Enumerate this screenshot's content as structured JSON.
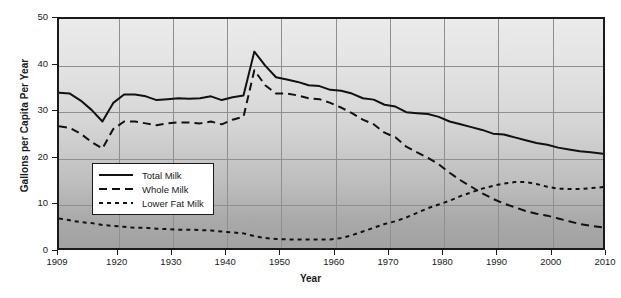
{
  "chart_data": {
    "type": "line",
    "title": "",
    "xlabel": "Year",
    "ylabel": "Gallons per Capita Per Year",
    "xlim": [
      1909,
      2010
    ],
    "ylim": [
      0,
      50
    ],
    "xticks": [
      1909,
      1920,
      1930,
      1940,
      1950,
      1960,
      1970,
      1980,
      1990,
      2000,
      2010
    ],
    "yticks": [
      0,
      10,
      20,
      30,
      40,
      50
    ],
    "grid": true,
    "legend_position": "inside-left",
    "x": [
      1909,
      1911,
      1913,
      1915,
      1917,
      1919,
      1921,
      1923,
      1925,
      1927,
      1929,
      1931,
      1933,
      1935,
      1937,
      1939,
      1941,
      1943,
      1945,
      1947,
      1949,
      1951,
      1953,
      1955,
      1957,
      1959,
      1961,
      1963,
      1965,
      1967,
      1969,
      1971,
      1973,
      1975,
      1977,
      1979,
      1981,
      1983,
      1985,
      1987,
      1989,
      1991,
      1993,
      1995,
      1997,
      1999,
      2001,
      2003,
      2005,
      2007,
      2010
    ],
    "series": [
      {
        "name": "Total Milk",
        "style": "solid",
        "color": "#111111",
        "values": [
          34.2,
          34.0,
          32.5,
          30.5,
          28.0,
          32.0,
          33.8,
          33.8,
          33.4,
          32.6,
          32.8,
          33.0,
          32.9,
          33.0,
          33.4,
          32.6,
          33.2,
          33.6,
          43.0,
          40.0,
          37.5,
          37.0,
          36.5,
          35.8,
          35.6,
          34.8,
          34.6,
          34.0,
          33.0,
          32.7,
          31.6,
          31.2,
          30.0,
          29.8,
          29.6,
          29.0,
          28.0,
          27.4,
          26.8,
          26.2,
          25.4,
          25.2,
          24.6,
          24.0,
          23.4,
          23.0,
          22.4,
          22.0,
          21.6,
          21.4,
          21.0
        ]
      },
      {
        "name": "Whole Milk",
        "style": "dashed",
        "color": "#111111",
        "values": [
          27.0,
          26.6,
          25.4,
          23.6,
          22.2,
          26.4,
          28.0,
          28.0,
          27.6,
          27.2,
          27.6,
          27.8,
          27.8,
          27.6,
          28.0,
          27.4,
          28.4,
          29.0,
          39.0,
          35.8,
          34.0,
          34.0,
          33.6,
          33.0,
          32.8,
          32.0,
          31.0,
          29.8,
          28.4,
          27.4,
          25.6,
          24.6,
          22.6,
          21.4,
          20.2,
          18.8,
          17.0,
          15.4,
          14.0,
          12.6,
          11.4,
          10.4,
          9.6,
          8.8,
          8.2,
          7.8,
          7.2,
          6.6,
          6.0,
          5.6,
          5.2
        ]
      },
      {
        "name": "Lower Fat Milk",
        "style": "dotted",
        "color": "#111111",
        "values": [
          7.2,
          6.8,
          6.4,
          6.2,
          5.8,
          5.6,
          5.4,
          5.2,
          5.2,
          5.0,
          4.9,
          4.8,
          4.8,
          4.7,
          4.6,
          4.4,
          4.2,
          4.0,
          3.4,
          3.0,
          2.8,
          2.7,
          2.7,
          2.7,
          2.7,
          2.7,
          3.0,
          3.6,
          4.4,
          5.2,
          6.0,
          6.6,
          7.4,
          8.4,
          9.4,
          10.2,
          11.0,
          12.0,
          12.8,
          13.6,
          14.2,
          14.7,
          15.0,
          15.0,
          14.6,
          14.0,
          13.6,
          13.5,
          13.5,
          13.7,
          14.0
        ]
      }
    ]
  },
  "legend": {
    "items": [
      {
        "label": "Total Milk",
        "style": "solid"
      },
      {
        "label": "Whole Milk",
        "style": "dashed"
      },
      {
        "label": "Lower Fat Milk",
        "style": "dotted"
      }
    ]
  }
}
